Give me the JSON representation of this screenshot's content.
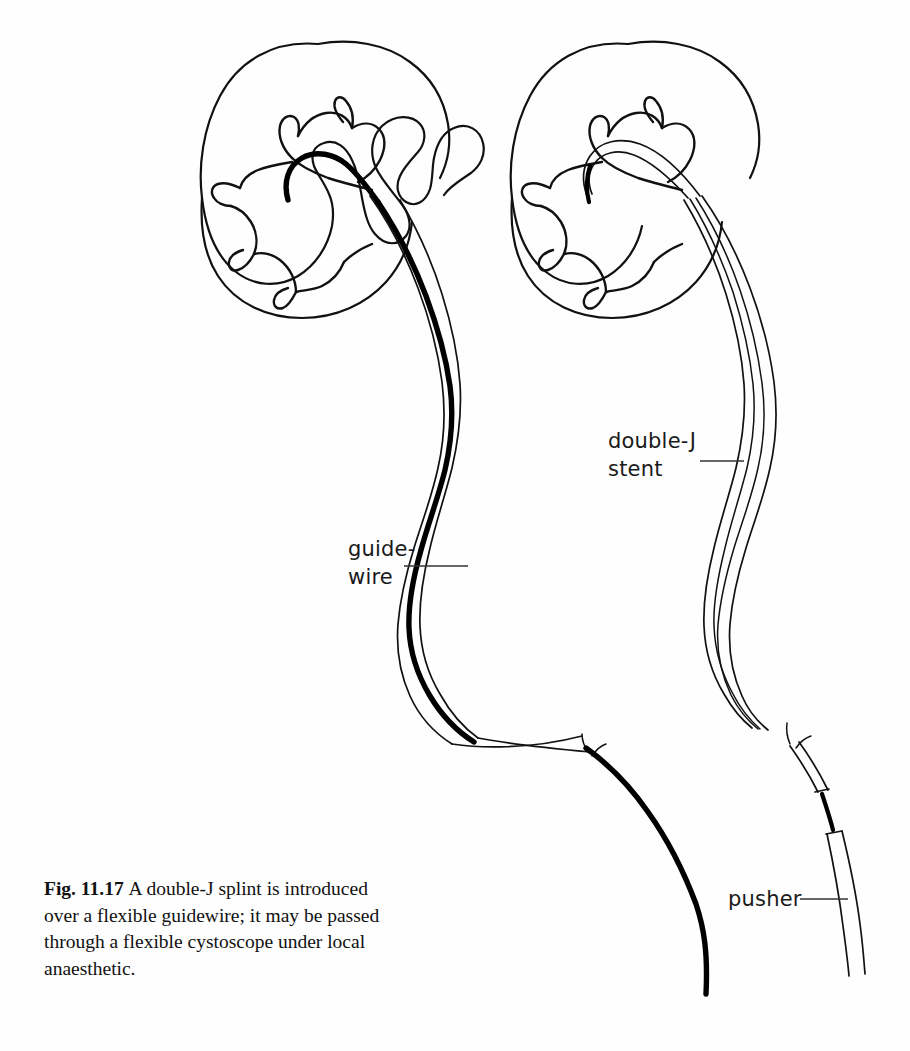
{
  "figure": {
    "number_label": "Fig. 11.17",
    "caption_text": "A double-J splint is introduced over a flexible guidewire; it may be passed through a flexible cystoscope under local anaesthetic.",
    "background_color": "#fefefe",
    "ink_color": "#111111"
  },
  "callouts": {
    "guidewire": {
      "line1": "guide-",
      "line2": "wire",
      "name": "guidewire"
    },
    "double_j_stent": {
      "line1": "double-J",
      "line2": "stent",
      "name": "double-J stent"
    },
    "pusher": {
      "line1": "pusher",
      "name": "pusher"
    }
  },
  "diagram": {
    "type": "medical-line-illustration",
    "panels": [
      {
        "id": "left-panel",
        "description": "Kidney with flexible guidewire coiled in the renal pelvis and passing down the ureter",
        "elements": [
          "kidney-outline",
          "renal-calyces",
          "ureter",
          "guidewire"
        ]
      },
      {
        "id": "right-panel",
        "description": "Kidney with double-J stent railroaded over the guidewire, pusher advancing the stent",
        "elements": [
          "kidney-outline",
          "renal-calyces",
          "ureter",
          "double-J-stent",
          "guidewire",
          "pusher"
        ]
      }
    ]
  }
}
